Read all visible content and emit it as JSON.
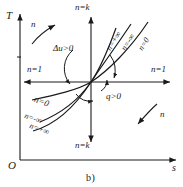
{
  "figure": {
    "caption": "b)",
    "axes": {
      "y_label": "T",
      "x_label": "s",
      "origin_label": "O"
    },
    "center_annotations": {
      "internal_energy": "Δu>0",
      "heat": "q>0"
    },
    "axis_line_labels": {
      "horizontal_left": "n=1",
      "horizontal_right": "n=1",
      "vertical_top": "n=k",
      "vertical_bottom": "n=k"
    },
    "direction_markers": [
      {
        "label": "n",
        "position": "upper-left",
        "arrow": "up-right"
      },
      {
        "label": "n",
        "position": "lower-right",
        "arrow": "up-right"
      }
    ],
    "curve_labels_upper_right": [
      "n=+∞",
      "n=-∞",
      "n=0"
    ],
    "curve_labels_lower_left": [
      "n=0",
      "n=-∞",
      "n=+∞"
    ],
    "colors": {
      "ink": "#1a1a1a",
      "background": "#ffffff"
    }
  }
}
